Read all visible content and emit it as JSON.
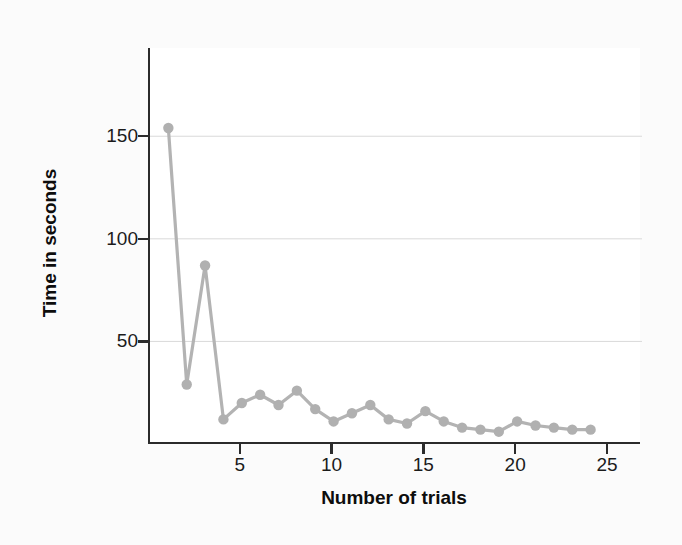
{
  "chart_data": {
    "type": "line",
    "title": "",
    "subtitle": "",
    "xlabel": "Number of trials",
    "ylabel": "Time in seconds",
    "x": [
      1,
      2,
      3,
      4,
      5,
      6,
      7,
      8,
      9,
      10,
      11,
      12,
      13,
      14,
      15,
      16,
      17,
      18,
      19,
      20,
      21,
      22,
      23,
      24
    ],
    "values": [
      154,
      29,
      87,
      12,
      20,
      24,
      19,
      26,
      17,
      11,
      15,
      19,
      12,
      10,
      16,
      11,
      8,
      7,
      6,
      11,
      9,
      8,
      7,
      7
    ],
    "series": [
      {
        "name": "Time in seconds",
        "values": [
          154,
          29,
          87,
          12,
          20,
          24,
          19,
          26,
          17,
          11,
          15,
          19,
          12,
          10,
          16,
          11,
          8,
          7,
          6,
          11,
          9,
          8,
          7,
          7
        ]
      }
    ],
    "xlim": [
      0,
      26.8
    ],
    "ylim": [
      0,
      193
    ],
    "xticks": [
      5,
      10,
      15,
      20,
      25
    ],
    "xtick_labels": [
      "5",
      "10",
      "15",
      "20",
      "25"
    ],
    "yticks": [
      50,
      100,
      150
    ],
    "ytick_labels": [
      "50",
      "100",
      "150"
    ],
    "grid": "horizontal",
    "legend": "none",
    "marker": "circle",
    "colors": {
      "line": "#b3b3b3",
      "marker": "#b0b0b0",
      "axis": "#2b2b2b",
      "grid": "#d9d9d9",
      "plot_background": "#ffffff",
      "page_background": "#fbfbfb",
      "text": "#1b1b1b"
    }
  },
  "axes": {
    "y_ticks": [
      {
        "label": "150",
        "value": 150
      },
      {
        "label": "100",
        "value": 100
      },
      {
        "label": "50",
        "value": 50
      }
    ],
    "x_ticks": [
      {
        "label": "5",
        "value": 5
      },
      {
        "label": "10",
        "value": 10
      },
      {
        "label": "15",
        "value": 15
      },
      {
        "label": "20",
        "value": 20
      },
      {
        "label": "25",
        "value": 25
      }
    ],
    "x_title": "Number of trials",
    "y_title": "Time in seconds"
  }
}
